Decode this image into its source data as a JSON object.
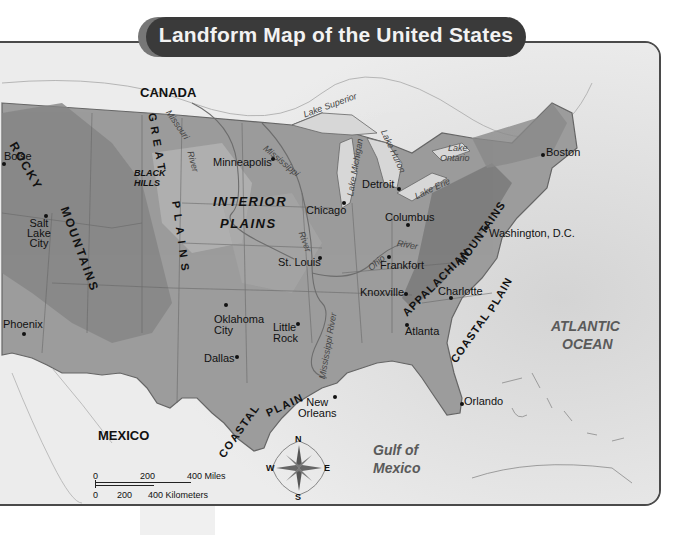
{
  "title": "Landform Map of the United States",
  "colors": {
    "title_bg": "#3a3a3a",
    "title_text": "#f2f2f2",
    "land": "#9a9a9a",
    "land_high": "#7c7c7c",
    "land_low": "#b8b8b8",
    "water": "#e4e4e4",
    "border": "#4a4a4a"
  },
  "countries": {
    "canada": "CANADA",
    "mexico": "MEXICO"
  },
  "regions": {
    "rocky_1": "ROCKY",
    "rocky_2": "MOUNTAINS",
    "great_1": "GREAT",
    "great_2": "PLAINS",
    "interior_1": "INTERIOR",
    "interior_2": "PLAINS",
    "appalachian_1": "APPALACHIAN",
    "appalachian_2": "MOUNTAINS",
    "coastal_gulf_1": "COASTAL",
    "coastal_gulf_2": "PLAIN",
    "coastal_atl_1": "COASTAL",
    "coastal_atl_2": "PLAIN",
    "black_hills_1": "BLACK",
    "black_hills_2": "HILLS"
  },
  "water_bodies": {
    "atlantic_1": "ATLANTIC",
    "atlantic_2": "OCEAN",
    "gulf_1": "Gulf of",
    "gulf_2": "Mexico",
    "lake_superior": "Lake Superior",
    "lake_michigan": "Lake Michigan",
    "lake_huron": "Lake Huron",
    "lake_ontario_1": "Lake",
    "lake_ontario_2": "Ontario",
    "lake_erie": "Lake Erie",
    "missouri_1": "Missouri",
    "missouri_2": "River",
    "mississippi_1": "Mississippi",
    "mississippi_2": "River",
    "mississippi_3": "Mississippi River",
    "ohio_1": "Ohio",
    "ohio_2": "River"
  },
  "cities": [
    {
      "name": "Boise"
    },
    {
      "name": "Salt Lake City"
    },
    {
      "name": "Phoenix"
    },
    {
      "name": "Minneapolis"
    },
    {
      "name": "Chicago"
    },
    {
      "name": "St. Louis"
    },
    {
      "name": "Detroit"
    },
    {
      "name": "Columbus"
    },
    {
      "name": "Frankfort"
    },
    {
      "name": "Knoxville"
    },
    {
      "name": "Charlotte"
    },
    {
      "name": "Atlanta"
    },
    {
      "name": "Boston"
    },
    {
      "name": "Washington, D.C."
    },
    {
      "name": "Oklahoma City"
    },
    {
      "name": "Little Rock"
    },
    {
      "name": "Dallas"
    },
    {
      "name": "New Orleans"
    },
    {
      "name": "Orlando"
    }
  ],
  "city_labels": {
    "salt_1": "Salt",
    "salt_2": "Lake",
    "salt_3": "City",
    "okc_1": "Oklahoma",
    "okc_2": "City",
    "lr_1": "Little",
    "lr_2": "Rock",
    "no_1": "New",
    "no_2": "Orleans"
  },
  "compass": {
    "n": "N",
    "s": "S",
    "e": "E",
    "w": "W"
  },
  "scale": {
    "miles": [
      "0",
      "200",
      "400 Miles"
    ],
    "km": [
      "0",
      "200",
      "400 Kilometers"
    ]
  }
}
